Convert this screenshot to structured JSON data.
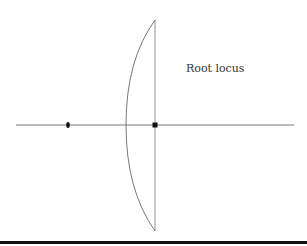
{
  "diagram": {
    "title": "Root locus",
    "axis": {
      "x1": 16,
      "x2": 294,
      "y": 125
    },
    "imaginary_line": {
      "x": 155,
      "y1": 20,
      "y2": 231
    },
    "locus_curve": {
      "top": [
        155,
        20
      ],
      "left": [
        126,
        125
      ],
      "bottom": [
        155,
        231
      ]
    },
    "markers": [
      {
        "type": "pole",
        "shape": "oval",
        "x": 68,
        "y": 125
      },
      {
        "type": "pole",
        "shape": "square",
        "x": 155,
        "y": 125
      }
    ],
    "colors": {
      "line": "#555555",
      "marker": "#111111",
      "rule": "#111111"
    }
  }
}
